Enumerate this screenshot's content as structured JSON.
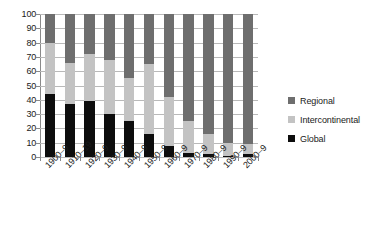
{
  "chart_data": {
    "type": "bar",
    "stacked": true,
    "stack_mode": "percent",
    "title": "",
    "subtitle": "",
    "xlabel": "",
    "ylabel": "",
    "ylim": [
      0,
      100
    ],
    "y_tick_step": 10,
    "grid": true,
    "grid_axis": "y",
    "legend_position": "right",
    "categories": [
      "1900–9",
      "1910–19",
      "1920–9",
      "1930–9",
      "1940–9",
      "1950–9",
      "1960–9",
      "1970–9",
      "1980–9",
      "1990–9",
      "2000–9"
    ],
    "y_ticks": [
      0,
      10,
      20,
      30,
      40,
      50,
      60,
      70,
      80,
      90,
      100
    ],
    "series": [
      {
        "name": "Global",
        "color": "#0d0d0d",
        "values": [
          44,
          37,
          39,
          30,
          25,
          16,
          8,
          3,
          2,
          1,
          2
        ]
      },
      {
        "name": "Intercontinental",
        "color": "#c3c3c3",
        "values": [
          36,
          29,
          33,
          38,
          30,
          49,
          34,
          22,
          14,
          9,
          7
        ]
      },
      {
        "name": "Regional",
        "color": "#6e6e6e",
        "values": [
          20,
          34,
          28,
          32,
          45,
          35,
          58,
          75,
          84,
          90,
          91
        ]
      }
    ],
    "stack_order_bottom_to_top": [
      "Global",
      "Intercontinental",
      "Regional"
    ],
    "legend_order_top_to_bottom": [
      "Regional",
      "Intercontinental",
      "Global"
    ]
  },
  "legend": {
    "items": [
      {
        "label": "Regional",
        "color": "#6e6e6e"
      },
      {
        "label": "Intercontinental",
        "color": "#c3c3c3"
      },
      {
        "label": "Global",
        "color": "#0d0d0d"
      }
    ]
  },
  "axes": {
    "y": {
      "ticks": [
        "0",
        "10",
        "20",
        "30",
        "40",
        "50",
        "60",
        "70",
        "80",
        "90",
        "100"
      ]
    },
    "x": {
      "ticks": [
        "1900–9",
        "1910–19",
        "1920–9",
        "1930–9",
        "1940–9",
        "1950–9",
        "1960–9",
        "1970–9",
        "1980–9",
        "1990–9",
        "2000–9"
      ]
    }
  }
}
